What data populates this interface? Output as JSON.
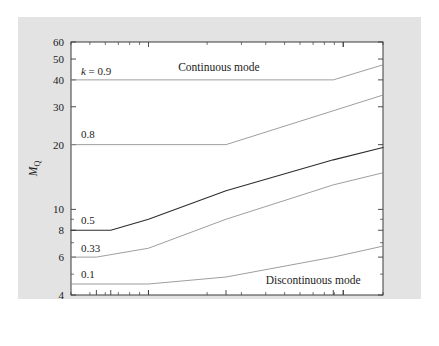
{
  "chart_data": {
    "type": "line",
    "title": "",
    "xlabel": "R/fL",
    "ylabel": "M_Q",
    "xscale": "log",
    "yscale": "log",
    "xlim": [
      40,
      1600
    ],
    "ylim": [
      4,
      60
    ],
    "grid": false,
    "legend_position": "inline-curve-labels",
    "xticks": [
      54,
      64,
      100,
      250,
      889
    ],
    "xtick_labels": [
      "54",
      "64",
      "100",
      "250",
      "889"
    ],
    "yticks": [
      4,
      6,
      8,
      10,
      20,
      30,
      40,
      50,
      60
    ],
    "ytick_labels": [
      "4",
      "6",
      "8",
      "10",
      "20",
      "30",
      "40",
      "50",
      "60"
    ],
    "annotations": [
      {
        "text": "Continuous mode",
        "x": 230,
        "y": 46
      },
      {
        "text": "Discontinuous mode",
        "x": 700,
        "y": 4.7
      }
    ],
    "series": [
      {
        "name": "k = 0.9",
        "label": "k = 0.9",
        "label_x": 45,
        "label_y": 44,
        "weight": "light",
        "x": [
          40,
          889,
          1600
        ],
        "y": [
          40,
          40,
          47
        ]
      },
      {
        "name": "0.8",
        "label": "0.8",
        "label_x": 45,
        "label_y": 22.5,
        "weight": "light",
        "x": [
          40,
          250,
          1600
        ],
        "y": [
          20,
          20,
          34
        ]
      },
      {
        "name": "0.5",
        "label": "0.5",
        "label_x": 45,
        "label_y": 8.9,
        "weight": "heavy",
        "x": [
          40,
          64,
          100,
          250,
          889,
          1600
        ],
        "y": [
          8,
          8,
          9.0,
          12.2,
          17.0,
          19.4
        ]
      },
      {
        "name": "0.33",
        "label": "0.33",
        "label_x": 45,
        "label_y": 6.6,
        "weight": "light",
        "x": [
          40,
          54,
          100,
          250,
          889,
          1600
        ],
        "y": [
          6,
          6,
          6.6,
          9.0,
          13.0,
          14.8
        ]
      },
      {
        "name": "0.1",
        "label": "0.1",
        "label_x": 45,
        "label_y": 5.0,
        "weight": "light",
        "x": [
          40,
          100,
          250,
          889,
          1600
        ],
        "y": [
          4.5,
          4.5,
          4.85,
          6.0,
          6.75
        ]
      }
    ]
  },
  "figure": {
    "background_color": "#e3e3e3",
    "plot_background_color": "#ffffff",
    "frame_color": "#3a3a3a"
  },
  "axes": {
    "x_title_main": "R/",
    "x_title_italic_f": "f",
    "x_title_tail": "L",
    "y_title_main": "M",
    "y_title_sub": "Q"
  }
}
